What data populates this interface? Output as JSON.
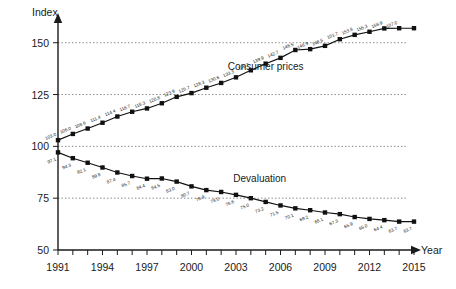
{
  "chart_data": {
    "type": "line",
    "title": "",
    "xlabel": "Year",
    "ylabel": "Index",
    "ylim": [
      50,
      160
    ],
    "xlim": [
      1991,
      2015
    ],
    "grid": true,
    "legend_position": "inline-labels",
    "y_ticks": [
      50,
      75,
      100,
      125,
      150
    ],
    "x_ticks": [
      1991,
      1994,
      1997,
      2000,
      2003,
      2006,
      2009,
      2012,
      2015
    ],
    "x_tick_labels": [
      "1991",
      "1994",
      "1997",
      "2000",
      "2003",
      "2006",
      "2009",
      "2012",
      "2015"
    ],
    "y_tick_labels": [
      "50",
      "75",
      "100",
      "125",
      "150"
    ],
    "x": [
      1991,
      1992,
      1993,
      1994,
      1995,
      1996,
      1997,
      1998,
      1999,
      2000,
      2001,
      2002,
      2003,
      2004,
      2005,
      2006,
      2007,
      2008,
      2009,
      2010,
      2011,
      2012,
      2013,
      2014,
      2015
    ],
    "series": [
      {
        "name": "Consumer prices",
        "values": [
          103.0,
          106.0,
          108.6,
          111.4,
          114.4,
          116.7,
          118.3,
          120.8,
          123.9,
          125.7,
          128.3,
          130.6,
          133.3,
          136.7,
          139.9,
          142.7,
          146.5,
          146.9,
          148.5,
          151.7,
          153.8,
          155.3,
          156.9,
          157.0,
          157.0
        ],
        "labels": [
          "103.0",
          "106.0",
          "108.6",
          "111.4",
          "114.4",
          "116.7",
          "118.3",
          "120.8",
          "123.9",
          "125.7",
          "128.3",
          "130.6",
          "133.3",
          "136.7",
          "139.9",
          "142.7",
          "146.5",
          "146.9",
          "148.5",
          "151.7",
          "153.8",
          "155.3",
          "156.9",
          "157.0",
          ""
        ]
      },
      {
        "name": "Devaluation",
        "values": [
          97.1,
          94.3,
          92.1,
          89.8,
          87.4,
          85.7,
          84.4,
          84.5,
          83.0,
          80.7,
          78.9,
          78.0,
          76.6,
          75.0,
          73.2,
          71.5,
          70.1,
          69.2,
          68.1,
          67.3,
          65.9,
          65.0,
          64.4,
          63.7,
          63.7
        ],
        "labels": [
          "97.1",
          "94.3",
          "92.1",
          "89.8",
          "87.4",
          "85.7",
          "84.4",
          "84.5",
          "83.0",
          "80.7",
          "78.9",
          "78.0",
          "76.6",
          "75.0",
          "73.2",
          "71.5",
          "70.1",
          "69.2",
          "68.1",
          "67.3",
          "65.9",
          "65.0",
          "64.4",
          "63.7",
          "63.7"
        ]
      }
    ],
    "annotations": [
      {
        "text": "Consumer prices",
        "x": 2005.0,
        "y": 137.0
      },
      {
        "text": "Devaluation",
        "x": 2004.6,
        "y": 83.0
      }
    ],
    "colors": {
      "line": "#111111",
      "marker": "#111111",
      "grid": "#555555",
      "axis": "#1a1a1a",
      "background": "#ffffff"
    }
  },
  "labels": {
    "y_axis_title": "Index",
    "x_axis_title": "Year"
  }
}
